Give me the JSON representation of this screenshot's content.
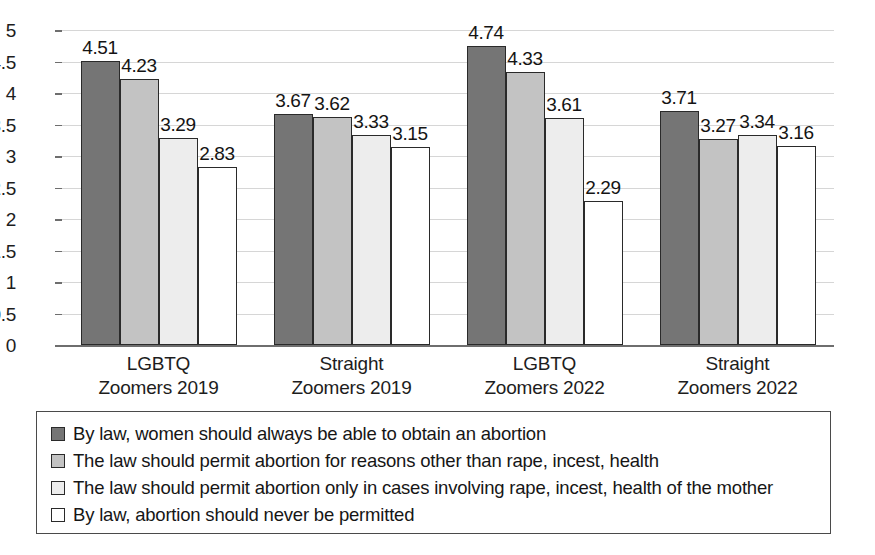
{
  "chart_data": {
    "type": "bar",
    "title": "",
    "subtitle": "",
    "xlabel": "",
    "ylabel": "",
    "ylim": [
      0,
      5
    ],
    "ytick_step": 0.5,
    "yticks": [
      "5",
      "4.5",
      "4",
      "3.5",
      "3",
      "2.5",
      "2",
      "1.5",
      "1",
      "0.5",
      "0"
    ],
    "grid": true,
    "legend_position": "bottom",
    "categories": [
      "LGBTQ\nZoomers 2019",
      "Straight\nZoomers 2019",
      "LGBTQ\nZoomers 2022",
      "Straight\nZoomers 2022"
    ],
    "category_lines": [
      [
        "LGBTQ",
        "Zoomers 2019"
      ],
      [
        "Straight",
        "Zoomers 2019"
      ],
      [
        "LGBTQ",
        "Zoomers 2022"
      ],
      [
        "Straight",
        "Zoomers 2022"
      ]
    ],
    "series": [
      {
        "name": "By law, women should always be able to obtain an abortion",
        "color": "#757575",
        "values": [
          4.51,
          3.67,
          4.74,
          3.71
        ],
        "labels": [
          "4.51",
          "3.67",
          "4.74",
          "3.71"
        ]
      },
      {
        "name": "The law should permit abortion for reasons other than rape, incest, health",
        "color": "#c3c3c3",
        "values": [
          4.23,
          3.62,
          4.33,
          3.27
        ],
        "labels": [
          "4.23",
          "3.62",
          "4.33",
          "3.27"
        ]
      },
      {
        "name": "The law should permit abortion only in cases involving rape, incest, health of the mother",
        "color": "#ededed",
        "values": [
          3.29,
          3.33,
          3.61,
          3.34
        ],
        "labels": [
          "3.29",
          "3.33",
          "3.61",
          "3.34"
        ]
      },
      {
        "name": "By law, abortion should never be permitted",
        "color": "#ffffff",
        "values": [
          2.83,
          3.15,
          2.29,
          3.16
        ],
        "labels": [
          "2.83",
          "3.15",
          "2.29",
          "3.16"
        ]
      }
    ]
  },
  "legend": {
    "entries": [
      {
        "label": "By law, women should always be able to obtain an abortion",
        "color": "#757575"
      },
      {
        "label": "The law should permit abortion for reasons other than rape, incest, health",
        "color": "#c3c3c3"
      },
      {
        "label": "The law should permit abortion only in cases involving rape, incest, health of the mother",
        "color": "#ededed"
      },
      {
        "label": "By law, abortion should never be permitted",
        "color": "#ffffff"
      }
    ]
  },
  "axis": {
    "y_min": 0,
    "y_max": 5,
    "gridline_color": "#d6d6d6",
    "axis_color": "#6e6e6e",
    "bar_outline_color": "#2a2a2a"
  }
}
